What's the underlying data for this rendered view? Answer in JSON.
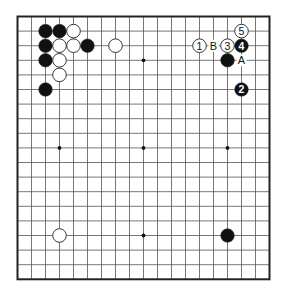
{
  "board": {
    "size": 19,
    "origin_x": 17.5,
    "origin_y": 16.5,
    "step_x": 14.0,
    "step_y": 14.6,
    "line_color": "#555555",
    "border_color": "#222222",
    "stone_black": "#111111",
    "stone_white": "#ffffff",
    "star_points": [
      [
        3,
        3
      ],
      [
        9,
        3
      ],
      [
        15,
        3
      ],
      [
        3,
        9
      ],
      [
        9,
        9
      ],
      [
        15,
        9
      ],
      [
        3,
        15
      ],
      [
        9,
        15
      ],
      [
        15,
        15
      ]
    ]
  },
  "stones": [
    {
      "color": "black",
      "col": 2,
      "row": 1,
      "label": ""
    },
    {
      "color": "black",
      "col": 3,
      "row": 1,
      "label": ""
    },
    {
      "color": "white",
      "col": 4,
      "row": 1,
      "label": ""
    },
    {
      "color": "black",
      "col": 2,
      "row": 2,
      "label": ""
    },
    {
      "color": "white",
      "col": 3,
      "row": 2,
      "label": ""
    },
    {
      "color": "white",
      "col": 4,
      "row": 2,
      "label": ""
    },
    {
      "color": "black",
      "col": 5,
      "row": 2,
      "label": ""
    },
    {
      "color": "white",
      "col": 7,
      "row": 2,
      "label": ""
    },
    {
      "color": "black",
      "col": 2,
      "row": 3,
      "label": ""
    },
    {
      "color": "white",
      "col": 3,
      "row": 3,
      "label": ""
    },
    {
      "color": "white",
      "col": 3,
      "row": 4,
      "label": ""
    },
    {
      "color": "black",
      "col": 2,
      "row": 5,
      "label": ""
    },
    {
      "color": "white",
      "col": 16,
      "row": 1,
      "label": "5"
    },
    {
      "color": "white",
      "col": 13,
      "row": 2,
      "label": "1"
    },
    {
      "color": "white",
      "col": 15,
      "row": 2,
      "label": "3"
    },
    {
      "color": "black",
      "col": 16,
      "row": 2,
      "label": "4"
    },
    {
      "color": "black",
      "col": 15,
      "row": 3,
      "label": ""
    },
    {
      "color": "black",
      "col": 16,
      "row": 5,
      "label": "2"
    },
    {
      "color": "white",
      "col": 3,
      "row": 15,
      "label": ""
    },
    {
      "color": "black",
      "col": 15,
      "row": 15,
      "label": ""
    }
  ],
  "markers": [
    {
      "text": "B",
      "col": 14,
      "row": 2
    },
    {
      "text": "A",
      "col": 16,
      "row": 3
    }
  ]
}
